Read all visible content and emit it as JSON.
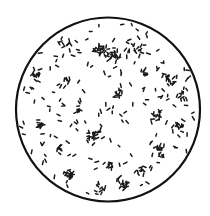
{
  "figure": {
    "field": {
      "cx": 108,
      "cy": 109.5,
      "r": 92,
      "stroke": "#111111",
      "stroke_width": 2.2,
      "fill": "#ffffff"
    },
    "rod_color": "#1a1a1a",
    "clusters": [
      {
        "x": 100,
        "y": 50,
        "n": 22,
        "spread": 10
      },
      {
        "x": 113,
        "y": 55,
        "n": 18,
        "spread": 9
      },
      {
        "x": 138,
        "y": 48,
        "n": 12,
        "spread": 10
      },
      {
        "x": 66,
        "y": 42,
        "n": 8,
        "spread": 8
      },
      {
        "x": 36,
        "y": 75,
        "n": 12,
        "spread": 8
      },
      {
        "x": 67,
        "y": 80,
        "n": 6,
        "spread": 5
      },
      {
        "x": 145,
        "y": 72,
        "n": 6,
        "spread": 6
      },
      {
        "x": 170,
        "y": 80,
        "n": 14,
        "spread": 9
      },
      {
        "x": 183,
        "y": 95,
        "n": 12,
        "spread": 8
      },
      {
        "x": 118,
        "y": 95,
        "n": 10,
        "spread": 8
      },
      {
        "x": 78,
        "y": 110,
        "n": 6,
        "spread": 4
      },
      {
        "x": 40,
        "y": 125,
        "n": 10,
        "spread": 7
      },
      {
        "x": 158,
        "y": 115,
        "n": 12,
        "spread": 8
      },
      {
        "x": 178,
        "y": 125,
        "n": 10,
        "spread": 7
      },
      {
        "x": 95,
        "y": 135,
        "n": 18,
        "spread": 10
      },
      {
        "x": 60,
        "y": 150,
        "n": 8,
        "spread": 6
      },
      {
        "x": 160,
        "y": 150,
        "n": 14,
        "spread": 9
      },
      {
        "x": 183,
        "y": 160,
        "n": 8,
        "spread": 6
      },
      {
        "x": 68,
        "y": 175,
        "n": 22,
        "spread": 8
      },
      {
        "x": 110,
        "y": 165,
        "n": 8,
        "spread": 7
      },
      {
        "x": 125,
        "y": 185,
        "n": 14,
        "spread": 8
      },
      {
        "x": 100,
        "y": 190,
        "n": 8,
        "spread": 8
      },
      {
        "x": 140,
        "y": 170,
        "n": 6,
        "spread": 6
      }
    ],
    "scatter_count": 170,
    "rod_length": [
      2.2,
      4.0
    ],
    "rod_width": 1.5,
    "seed": 7
  }
}
